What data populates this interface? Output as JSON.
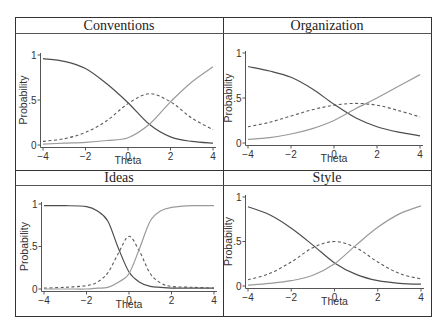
{
  "figure": {
    "panel_titles": [
      "Conventions",
      "Organization",
      "Ideas",
      "Style"
    ],
    "xlabel": "Theta",
    "ylabel": "Probability"
  },
  "colors": {
    "low_category": "#4d4d4d",
    "middle_category": "#5a5a5a",
    "high_category": "#9a9a9a",
    "frame": "#333333",
    "axis": "#555555"
  },
  "chart_data": [
    {
      "type": "line",
      "title": "Conventions",
      "xlabel": "Theta",
      "ylabel": "Probability",
      "xlim": [
        -4,
        4
      ],
      "ylim": [
        0,
        1
      ],
      "xticks": [
        -4,
        -2,
        0,
        2,
        4
      ],
      "xtick_labels": [
        "-4",
        "-2",
        "0",
        "2",
        "4"
      ],
      "yticks": [
        0,
        0.5,
        1
      ],
      "ytick_labels": [
        "0",
        ".5",
        "1"
      ],
      "grid": false,
      "x": [
        -4,
        -3,
        -2,
        -1,
        0,
        1,
        2,
        3,
        4
      ],
      "series": [
        {
          "name": "low",
          "style": "solid-dark",
          "values": [
            0.96,
            0.93,
            0.85,
            0.68,
            0.47,
            0.23,
            0.09,
            0.04,
            0.02
          ]
        },
        {
          "name": "middle",
          "style": "dashed",
          "values": [
            0.04,
            0.07,
            0.14,
            0.27,
            0.46,
            0.57,
            0.48,
            0.3,
            0.17
          ]
        },
        {
          "name": "high",
          "style": "solid-light",
          "values": [
            0.01,
            0.02,
            0.03,
            0.05,
            0.08,
            0.23,
            0.48,
            0.7,
            0.87
          ]
        }
      ]
    },
    {
      "type": "line",
      "title": "Organization",
      "xlabel": "Theta",
      "ylabel": "Probability",
      "xlim": [
        -4,
        4
      ],
      "ylim": [
        0,
        1
      ],
      "xticks": [
        -4,
        -2,
        0,
        2,
        4
      ],
      "xtick_labels": [
        "-4",
        "-2",
        "0",
        "2",
        "4"
      ],
      "yticks": [
        0,
        0.5,
        1
      ],
      "ytick_labels": [
        "0",
        ".5",
        "1"
      ],
      "grid": false,
      "x": [
        -4,
        -3,
        -2,
        -1,
        0,
        1,
        2,
        3,
        4
      ],
      "series": [
        {
          "name": "low",
          "style": "solid-dark",
          "values": [
            0.85,
            0.8,
            0.73,
            0.6,
            0.43,
            0.28,
            0.18,
            0.12,
            0.08
          ]
        },
        {
          "name": "middle",
          "style": "dashed",
          "values": [
            0.18,
            0.23,
            0.3,
            0.37,
            0.42,
            0.44,
            0.42,
            0.36,
            0.29
          ]
        },
        {
          "name": "high",
          "style": "solid-light",
          "values": [
            0.04,
            0.06,
            0.1,
            0.16,
            0.25,
            0.38,
            0.5,
            0.63,
            0.76
          ]
        }
      ]
    },
    {
      "type": "line",
      "title": "Ideas",
      "xlabel": "Theta",
      "ylabel": "Probability",
      "xlim": [
        -4,
        4
      ],
      "ylim": [
        0,
        1
      ],
      "xticks": [
        -4,
        -2,
        0,
        2,
        4
      ],
      "xtick_labels": [
        "-4",
        "-2",
        "0",
        "2",
        "4"
      ],
      "yticks": [
        0,
        0.5,
        1
      ],
      "ytick_labels": [
        "0",
        ".5",
        "1"
      ],
      "grid": false,
      "x": [
        -4,
        -3,
        -2,
        -1.5,
        -1,
        -0.5,
        0,
        0.5,
        1,
        1.5,
        2,
        3,
        4
      ],
      "series": [
        {
          "name": "low",
          "style": "solid-dark",
          "values": [
            0.98,
            0.98,
            0.97,
            0.92,
            0.8,
            0.48,
            0.2,
            0.08,
            0.03,
            0.02,
            0.01,
            0.01,
            0.01
          ]
        },
        {
          "name": "middle",
          "style": "dashed",
          "values": [
            0.01,
            0.02,
            0.04,
            0.08,
            0.19,
            0.42,
            0.62,
            0.44,
            0.18,
            0.07,
            0.03,
            0.02,
            0.01
          ]
        },
        {
          "name": "high",
          "style": "solid-light",
          "values": [
            0.0,
            0.0,
            0.0,
            0.01,
            0.02,
            0.08,
            0.18,
            0.48,
            0.8,
            0.92,
            0.96,
            0.98,
            0.98
          ]
        }
      ]
    },
    {
      "type": "line",
      "title": "Style",
      "xlabel": "Theta",
      "ylabel": "Probability",
      "xlim": [
        -4,
        4
      ],
      "ylim": [
        0,
        1
      ],
      "xticks": [
        -4,
        -2,
        0,
        2,
        4
      ],
      "xtick_labels": [
        "-4",
        "-2",
        "0",
        "2",
        "4"
      ],
      "yticks": [
        0,
        0.5,
        1
      ],
      "ytick_labels": [
        "0",
        ".5",
        "1"
      ],
      "grid": false,
      "x": [
        -4,
        -3,
        -2,
        -1,
        0,
        1,
        2,
        3,
        4
      ],
      "series": [
        {
          "name": "low",
          "style": "solid-dark",
          "values": [
            0.89,
            0.8,
            0.65,
            0.46,
            0.26,
            0.13,
            0.06,
            0.03,
            0.02
          ]
        },
        {
          "name": "middle",
          "style": "dashed",
          "values": [
            0.07,
            0.14,
            0.27,
            0.43,
            0.5,
            0.43,
            0.27,
            0.14,
            0.08
          ]
        },
        {
          "name": "high",
          "style": "solid-light",
          "values": [
            0.01,
            0.03,
            0.06,
            0.12,
            0.25,
            0.46,
            0.66,
            0.81,
            0.9
          ]
        }
      ]
    }
  ]
}
